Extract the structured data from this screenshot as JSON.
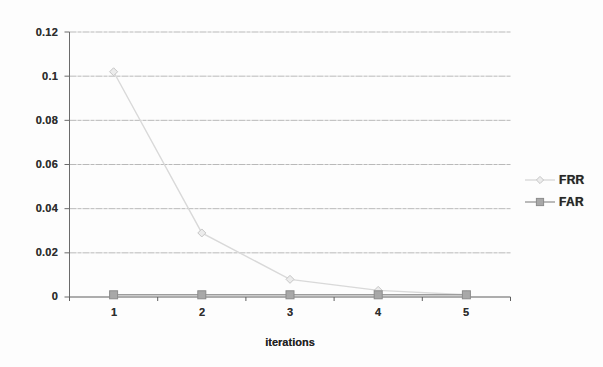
{
  "chart_data": {
    "type": "line",
    "title": "",
    "xlabel": "iterations",
    "ylabel": "",
    "categories": [
      "1",
      "2",
      "3",
      "4",
      "5"
    ],
    "series": [
      {
        "name": "FRR",
        "values": [
          0.102,
          0.029,
          0.008,
          0.003,
          0.001
        ],
        "line_color": "#d9d9d9",
        "marker": "diamond",
        "marker_fill": "#ececec",
        "marker_stroke": "#c6c6c6"
      },
      {
        "name": "FAR",
        "values": [
          0.001,
          0.001,
          0.001,
          0.001,
          0.001
        ],
        "line_color": "#9c9c9c",
        "marker": "square",
        "marker_fill": "#a8a8a8",
        "marker_stroke": "#8c8c8c"
      }
    ],
    "ylim": [
      0,
      0.12
    ],
    "ytick_values": [
      0,
      0.02,
      0.04,
      0.06,
      0.08,
      0.1,
      0.12
    ],
    "ytick_labels": [
      "0",
      "0.02",
      "0.04",
      "0.06",
      "0.08",
      "0.1",
      "0.12"
    ],
    "grid": "horizontal",
    "legend_position": "right",
    "gridline_color": "#a9a9a9",
    "axis_color": "#6b6b6b",
    "x_axis_color": "#5f5f5f",
    "text_color": "#2e2e2e"
  }
}
